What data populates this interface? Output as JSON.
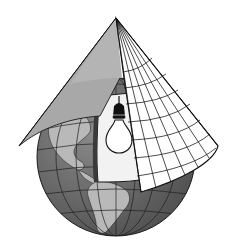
{
  "figure": {
    "elements": [
      "globe",
      "cone",
      "light-bulb",
      "graticule",
      "continents"
    ],
    "colors": {
      "background": "#ffffff",
      "ocean": "#6f6f6f",
      "land": "#b9b9b9",
      "cone_shaded": "#a8a8a8",
      "cone_paper": "#ffffff",
      "cutaway": "#f2f2f2",
      "line": "#1a1a1a"
    }
  }
}
